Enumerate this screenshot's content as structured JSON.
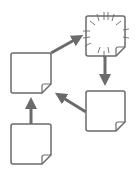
{
  "diagram": {
    "title": "",
    "colors": {
      "stroke": "#6b6b6b",
      "arrow": "#6b6b6b",
      "fill": "#ffffff",
      "background": "#ffffff"
    },
    "nodes": [
      {
        "id": "doc-left-middle",
        "type": "document",
        "icon": "document-icon"
      },
      {
        "id": "doc-top-right",
        "type": "burst-document",
        "icon": "burst-document-icon"
      },
      {
        "id": "doc-right-bottom",
        "type": "document",
        "icon": "document-icon"
      },
      {
        "id": "doc-bottom-left",
        "type": "document",
        "icon": "document-icon"
      }
    ],
    "edges": [
      {
        "from": "doc-bottom-left",
        "to": "doc-left-middle"
      },
      {
        "from": "doc-left-middle",
        "to": "doc-top-right"
      },
      {
        "from": "doc-top-right",
        "to": "doc-right-bottom"
      },
      {
        "from": "doc-right-bottom",
        "to": "doc-left-middle"
      }
    ]
  }
}
